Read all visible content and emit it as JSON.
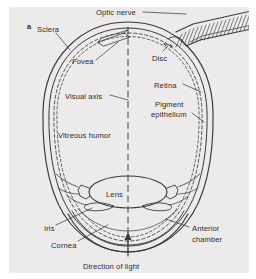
{
  "figure": {
    "panel_label": "a",
    "background_color": "#eceaea",
    "ink_color": "#3a3838",
    "caption_note": ""
  },
  "labels": [
    {
      "name": "optic-nerve",
      "text": "Optic nerve",
      "x": 96,
      "y": 8,
      "leader": true
    },
    {
      "name": "sclera",
      "text": "Sclera",
      "x": 37,
      "y": 25,
      "leader": true
    },
    {
      "name": "fovea",
      "text": "Fovea",
      "x": 72,
      "y": 57,
      "leader": true
    },
    {
      "name": "disc",
      "text": "Disc",
      "x": 152,
      "y": 54,
      "leader": true
    },
    {
      "name": "visual-axis",
      "text": "Visual axis",
      "x": 65,
      "y": 92,
      "leader": true
    },
    {
      "name": "retina",
      "text": "Retina",
      "x": 154,
      "y": 81,
      "leader": true
    },
    {
      "name": "pigment",
      "text": "Pigment",
      "x": 155,
      "y": 100,
      "leader": false
    },
    {
      "name": "epithelium",
      "text": "epithelium",
      "x": 151,
      "y": 110,
      "leader": true
    },
    {
      "name": "vitreous-humor",
      "text": "Vitreous humor",
      "x": 58,
      "y": 131,
      "leader": false
    },
    {
      "name": "lens",
      "text": "Lens",
      "x": 106,
      "y": 190,
      "leader": false
    },
    {
      "name": "iris",
      "text": "Iris",
      "x": 44,
      "y": 224,
      "leader": true
    },
    {
      "name": "anterior",
      "text": "Anterior",
      "x": 192,
      "y": 224,
      "leader": true
    },
    {
      "name": "chamber",
      "text": "chamber",
      "x": 192,
      "y": 235,
      "leader": false
    },
    {
      "name": "cornea",
      "text": "Cornea",
      "x": 51,
      "y": 241,
      "leader": true
    },
    {
      "name": "direction-of-light",
      "text": "Direction of light",
      "x": 83,
      "y": 262,
      "leader": false
    }
  ],
  "structures": [
    {
      "name": "sclera-outer-wall",
      "kind": "outline"
    },
    {
      "name": "sclera-inner-wall",
      "kind": "outline"
    },
    {
      "name": "retina-layer",
      "kind": "dashed-line"
    },
    {
      "name": "pigment-epithelium-layer",
      "kind": "dashed-line"
    },
    {
      "name": "optic-nerve-bundle",
      "kind": "hatched-band"
    },
    {
      "name": "optic-disc",
      "kind": "notch"
    },
    {
      "name": "fovea-marker-box",
      "kind": "parallelogram"
    },
    {
      "name": "visual-axis-line",
      "kind": "dashed-axis"
    },
    {
      "name": "lens-body",
      "kind": "ellipse"
    },
    {
      "name": "ciliary-body-left",
      "kind": "shape"
    },
    {
      "name": "ciliary-body-right",
      "kind": "shape"
    },
    {
      "name": "iris-flap-left",
      "kind": "shape"
    },
    {
      "name": "iris-flap-right",
      "kind": "shape"
    },
    {
      "name": "cornea-dome",
      "kind": "arc"
    },
    {
      "name": "anterior-chamber-space",
      "kind": "region"
    },
    {
      "name": "light-direction-arrow",
      "kind": "arrow"
    }
  ]
}
